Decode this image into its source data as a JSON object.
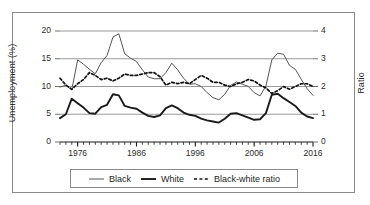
{
  "chart_data": {
    "type": "line",
    "title": "",
    "subtitle": "",
    "xlabel": "",
    "ylabel": "Unemployment (%)",
    "y2label": "Ratio",
    "xlim": [
      1973,
      2016
    ],
    "ylim": [
      0,
      20
    ],
    "y2lim": [
      0,
      4
    ],
    "grid": true,
    "legend_position": "bottom",
    "x_tick_labels": [
      "1976",
      "1986",
      "1996",
      "2006",
      "2016"
    ],
    "x_tick_values": [
      1976,
      1986,
      1996,
      2006,
      2016
    ],
    "y_tick_labels": [
      "0",
      "5",
      "10",
      "15",
      "20"
    ],
    "y_tick_values": [
      0,
      5,
      10,
      15,
      20
    ],
    "y2_tick_labels": [
      "0",
      "1",
      "2",
      "3",
      "4"
    ],
    "y2_tick_values": [
      0,
      1,
      2,
      3,
      4
    ],
    "x": [
      1973,
      1974,
      1975,
      1976,
      1977,
      1978,
      1979,
      1980,
      1981,
      1982,
      1983,
      1984,
      1985,
      1986,
      1987,
      1988,
      1989,
      1990,
      1991,
      1992,
      1993,
      1994,
      1995,
      1996,
      1997,
      1998,
      1999,
      2000,
      2001,
      2002,
      2003,
      2004,
      2005,
      2006,
      2007,
      2008,
      2009,
      2010,
      2011,
      2012,
      2013,
      2014,
      2015,
      2016
    ],
    "series": [
      {
        "name": "Black",
        "axis": "left",
        "style": "thin-solid",
        "color": "#555555",
        "values": [
          9.9,
          10.2,
          9.4,
          14.8,
          14.0,
          13.1,
          12.3,
          14.3,
          15.6,
          18.9,
          19.5,
          15.9,
          15.1,
          14.5,
          13.0,
          11.7,
          11.4,
          11.4,
          12.5,
          14.2,
          13.0,
          11.5,
          10.4,
          10.5,
          10.0,
          8.9,
          8.0,
          7.6,
          8.6,
          10.2,
          10.8,
          10.4,
          10.0,
          8.9,
          8.3,
          10.1,
          14.8,
          16.0,
          15.8,
          13.8,
          13.1,
          11.3,
          9.6,
          8.4
        ]
      },
      {
        "name": "White",
        "axis": "left",
        "style": "thick-solid",
        "color": "#1a1a1a",
        "values": [
          4.3,
          5.0,
          7.8,
          7.0,
          6.2,
          5.2,
          5.1,
          6.3,
          6.7,
          8.6,
          8.4,
          6.5,
          6.2,
          6.0,
          5.3,
          4.7,
          4.5,
          4.8,
          6.1,
          6.6,
          6.1,
          5.3,
          4.9,
          4.7,
          4.2,
          3.9,
          3.7,
          3.5,
          4.2,
          5.1,
          5.2,
          4.8,
          4.4,
          4.0,
          4.1,
          5.2,
          8.5,
          8.7,
          7.9,
          7.2,
          6.5,
          5.3,
          4.6,
          4.3
        ]
      },
      {
        "name": "Black-white ratio",
        "axis": "right",
        "style": "dashed",
        "color": "#111111",
        "values": [
          2.3,
          2.05,
          1.9,
          2.1,
          2.25,
          2.5,
          2.4,
          2.25,
          2.3,
          2.2,
          2.3,
          2.45,
          2.4,
          2.4,
          2.45,
          2.5,
          2.5,
          2.35,
          2.05,
          2.15,
          2.1,
          2.15,
          2.1,
          2.25,
          2.4,
          2.3,
          2.15,
          2.15,
          2.05,
          2.0,
          2.1,
          2.15,
          2.25,
          2.2,
          2.05,
          1.95,
          1.75,
          1.85,
          2.0,
          1.9,
          2.0,
          2.1,
          2.1,
          2.0
        ]
      }
    ]
  },
  "legend": {
    "items": [
      {
        "label": "Black",
        "style": "thin-solid"
      },
      {
        "label": "White",
        "style": "thick-solid"
      },
      {
        "label": "Black-white ratio",
        "style": "dashed"
      }
    ]
  },
  "axes": {
    "left_title": "Unemployment (%)",
    "right_title": "Ratio"
  },
  "colors": {
    "black_series": "#555555",
    "white_series": "#1a1a1a",
    "ratio_series": "#111111",
    "gridline": "#9a9a9a",
    "frame": "#8a8a8a",
    "text": "#2b2b2b"
  }
}
